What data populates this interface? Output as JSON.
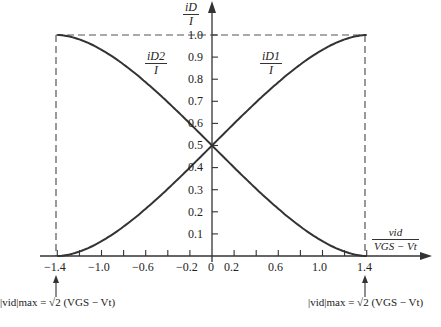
{
  "chart_data": {
    "type": "line",
    "title": "",
    "xlabel": "v_id / (V_GS − V_t)",
    "ylabel": "i_D / I",
    "xlim": [
      -1.4,
      1.4
    ],
    "ylim": [
      0,
      1.0
    ],
    "grid": false,
    "x_ticks": [
      -1.4,
      -1.2,
      -1.0,
      -0.8,
      -0.6,
      -0.4,
      -0.2,
      0,
      0.2,
      0.4,
      0.6,
      0.8,
      1.0,
      1.2,
      1.4
    ],
    "x_tick_labels": [
      "−1.4",
      "−1.0",
      "−0.6",
      "−0.2",
      "0",
      "0.2",
      "0.6",
      "1.0",
      "1.4"
    ],
    "y_ticks": [
      0.1,
      0.2,
      0.3,
      0.4,
      0.5,
      0.6,
      0.7,
      0.8,
      0.9,
      1.0
    ],
    "y_tick_labels": [
      "0.1",
      "0.2",
      "0.3",
      "0.4",
      "0.5",
      "0.6",
      "0.7",
      "0.8",
      "0.9",
      "1.0"
    ],
    "x": [
      -1.4,
      -1.2,
      -1.0,
      -0.8,
      -0.6,
      -0.4,
      -0.2,
      0,
      0.2,
      0.4,
      0.6,
      0.8,
      1.0,
      1.2,
      1.4
    ],
    "series": [
      {
        "name": "i_D1 / I",
        "values": [
          0.0,
          0.02,
          0.071,
          0.145,
          0.235,
          0.332,
          0.43,
          0.5,
          0.57,
          0.668,
          0.765,
          0.855,
          0.929,
          0.98,
          1.0
        ]
      },
      {
        "name": "i_D2 / I",
        "values": [
          1.0,
          0.98,
          0.929,
          0.855,
          0.765,
          0.668,
          0.57,
          0.5,
          0.43,
          0.332,
          0.235,
          0.145,
          0.071,
          0.02,
          0.0
        ]
      }
    ],
    "annotations": [
      "|v_id|max = √2 (V_GS − V_t)  (at x = −1.4)",
      "|v_id|max = √2 (V_GS − V_t)  (at x = 1.4)",
      "Dashed bounding lines at y = 1.0 and x = ±1.4"
    ]
  },
  "labels": {
    "y_axis_num": "iD",
    "y_axis_den": "I",
    "x_axis_num": "vid",
    "x_axis_den": "VGS − Vt",
    "curve1_num": "iD1",
    "curve1_den": "I",
    "curve2_num": "iD2",
    "curve2_den": "I",
    "anno_left": "|vid|max = √2 (VGS − Vt)",
    "anno_right": "|vid|max = √2 (VGS − Vt)"
  },
  "ticks": {
    "y": [
      "1.0",
      "0.9",
      "0.8",
      "0.7",
      "0.6",
      "0.5",
      "0.4",
      "0.3",
      "0.2",
      "0.1"
    ],
    "x": [
      "−1.4",
      "−1.0",
      "−0.6",
      "−0.2",
      "0",
      "0.2",
      "0.6",
      "1.0",
      "1.4"
    ]
  },
  "colors": {
    "curve": "#333333",
    "axis": "#333333",
    "dash": "#555555"
  }
}
